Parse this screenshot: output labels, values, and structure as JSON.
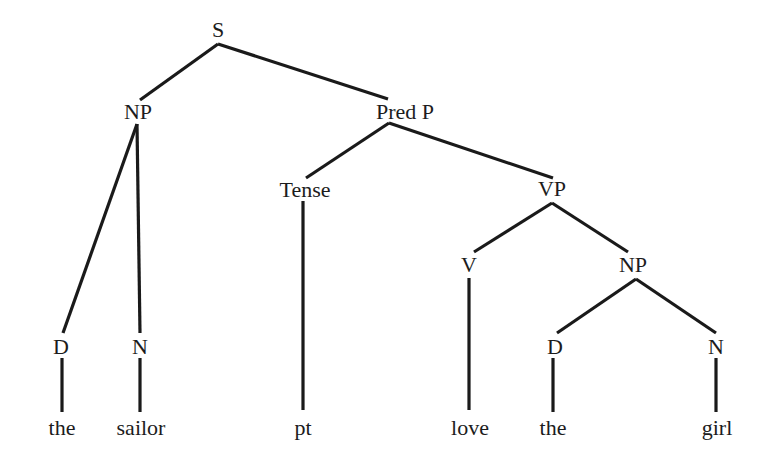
{
  "diagram": {
    "type": "syntax-tree",
    "nodes": [
      {
        "id": "S",
        "label": "S",
        "x": 218,
        "y": 30
      },
      {
        "id": "NP1",
        "label": "NP",
        "x": 138,
        "y": 112
      },
      {
        "id": "PredP",
        "label": "Pred P",
        "x": 405,
        "y": 112
      },
      {
        "id": "Tense",
        "label": "Tense",
        "x": 305,
        "y": 190
      },
      {
        "id": "VP",
        "label": "VP",
        "x": 552,
        "y": 189
      },
      {
        "id": "V",
        "label": "V",
        "x": 469,
        "y": 265
      },
      {
        "id": "NP2",
        "label": "NP",
        "x": 633,
        "y": 265
      },
      {
        "id": "D1",
        "label": "D",
        "x": 61,
        "y": 347
      },
      {
        "id": "N1",
        "label": "N",
        "x": 140,
        "y": 347
      },
      {
        "id": "D2",
        "label": "D",
        "x": 555,
        "y": 347
      },
      {
        "id": "N2",
        "label": "N",
        "x": 716,
        "y": 347
      }
    ],
    "leaves": [
      {
        "id": "the1",
        "label": "the",
        "x": 62,
        "y": 428
      },
      {
        "id": "sailor",
        "label": "sailor",
        "x": 141,
        "y": 428
      },
      {
        "id": "pt",
        "label": "pt",
        "x": 303,
        "y": 428
      },
      {
        "id": "love",
        "label": "love",
        "x": 470,
        "y": 428
      },
      {
        "id": "the2",
        "label": "the",
        "x": 553,
        "y": 428
      },
      {
        "id": "girl",
        "label": "girl",
        "x": 717,
        "y": 428
      }
    ],
    "edges": [
      {
        "from": "S",
        "to": "NP1",
        "x1": 218,
        "y1": 44,
        "x2": 140,
        "y2": 100
      },
      {
        "from": "S",
        "to": "PredP",
        "x1": 218,
        "y1": 44,
        "x2": 388,
        "y2": 99
      },
      {
        "from": "NP1",
        "to": "D1",
        "x1": 137,
        "y1": 124,
        "x2": 63,
        "y2": 333
      },
      {
        "from": "NP1",
        "to": "N1",
        "x1": 137,
        "y1": 124,
        "x2": 140,
        "y2": 333
      },
      {
        "from": "PredP",
        "to": "Tense",
        "x1": 389,
        "y1": 123,
        "x2": 306,
        "y2": 178
      },
      {
        "from": "PredP",
        "to": "VP",
        "x1": 389,
        "y1": 123,
        "x2": 553,
        "y2": 178
      },
      {
        "from": "VP",
        "to": "V",
        "x1": 552,
        "y1": 203,
        "x2": 474,
        "y2": 252
      },
      {
        "from": "VP",
        "to": "NP2",
        "x1": 552,
        "y1": 203,
        "x2": 628,
        "y2": 252
      },
      {
        "from": "NP2",
        "to": "D2",
        "x1": 636,
        "y1": 279,
        "x2": 557,
        "y2": 333
      },
      {
        "from": "NP2",
        "to": "N2",
        "x1": 636,
        "y1": 279,
        "x2": 716,
        "y2": 333
      },
      {
        "from": "D1",
        "to": "the1",
        "x1": 62,
        "y1": 358,
        "x2": 62,
        "y2": 412
      },
      {
        "from": "N1",
        "to": "sailor",
        "x1": 140,
        "y1": 358,
        "x2": 140,
        "y2": 412
      },
      {
        "from": "Tense",
        "to": "pt",
        "x1": 303,
        "y1": 201,
        "x2": 303,
        "y2": 410
      },
      {
        "from": "V",
        "to": "love",
        "x1": 469,
        "y1": 278,
        "x2": 469,
        "y2": 410
      },
      {
        "from": "D2",
        "to": "the2",
        "x1": 553,
        "y1": 358,
        "x2": 553,
        "y2": 412
      },
      {
        "from": "N2",
        "to": "girl",
        "x1": 716,
        "y1": 358,
        "x2": 716,
        "y2": 412
      }
    ]
  }
}
